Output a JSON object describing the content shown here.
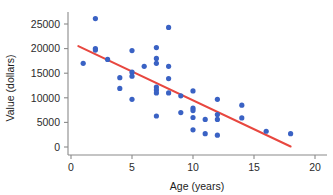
{
  "chart_data": {
    "type": "scatter",
    "title": "",
    "xlabel": "Age (years)",
    "ylabel": "Value (dollars)",
    "xlim": [
      0,
      20
    ],
    "ylim": [
      0,
      27000
    ],
    "xticks": [
      0,
      5,
      10,
      15,
      20
    ],
    "xtick_labels": [
      "0",
      "5",
      "10",
      "15",
      "20"
    ],
    "yticks": [
      0,
      5000,
      10000,
      15000,
      20000,
      25000
    ],
    "ytick_labels": [
      "0",
      "5000",
      "10000",
      "15000",
      "20000",
      "25000"
    ],
    "grid": false,
    "legend": false,
    "point_color": "#3a62c4",
    "trendline_color": "#e8473f",
    "axis_color": "#8a8a8a",
    "series": [
      {
        "name": "Vehicles",
        "marker": "circle",
        "color": "#3a62c4",
        "points": [
          [
            1,
            17000
          ],
          [
            2,
            26100
          ],
          [
            2,
            20000
          ],
          [
            2,
            19700
          ],
          [
            3,
            17800
          ],
          [
            4,
            14100
          ],
          [
            4,
            11900
          ],
          [
            5,
            19600
          ],
          [
            5,
            15200
          ],
          [
            5,
            14400
          ],
          [
            5,
            9700
          ],
          [
            6,
            16400
          ],
          [
            7,
            20200
          ],
          [
            7,
            18000
          ],
          [
            7,
            17000
          ],
          [
            7,
            12200
          ],
          [
            7,
            11600
          ],
          [
            7,
            11000
          ],
          [
            7,
            6300
          ],
          [
            8,
            24300
          ],
          [
            8,
            16400
          ],
          [
            8,
            13900
          ],
          [
            8,
            11000
          ],
          [
            9,
            10400
          ],
          [
            9,
            7000
          ],
          [
            10,
            11400
          ],
          [
            10,
            7900
          ],
          [
            10,
            7400
          ],
          [
            10,
            6000
          ],
          [
            10,
            3500
          ],
          [
            11,
            5600
          ],
          [
            11,
            2700
          ],
          [
            12,
            9700
          ],
          [
            12,
            6600
          ],
          [
            12,
            5600
          ],
          [
            12,
            2400
          ],
          [
            14,
            8500
          ],
          [
            14,
            5900
          ],
          [
            16,
            3200
          ],
          [
            18,
            2700
          ]
        ]
      }
    ],
    "trendline": {
      "name": "linear-fit",
      "color": "#e8473f",
      "x_start": 0.6,
      "y_start": 20500,
      "x_end": 18.0,
      "y_end": 100
    }
  }
}
